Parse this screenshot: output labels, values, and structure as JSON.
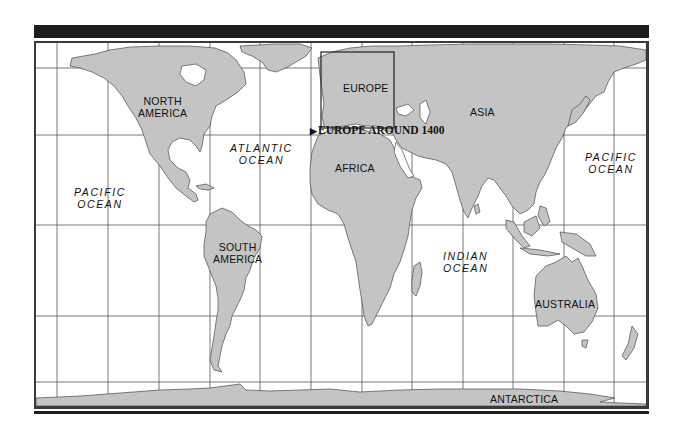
{
  "map": {
    "type": "world-map",
    "projection_grid": {
      "vertical_gridlines_x": [
        57,
        108,
        159,
        210,
        260,
        311,
        362,
        412,
        463,
        513,
        564,
        614
      ],
      "horizontal_gridlines_y": [
        68,
        135,
        225,
        316,
        382
      ]
    },
    "colors": {
      "land": "#c4c4c4",
      "land_outline": "#4a4a4a",
      "ocean": "#ffffff",
      "grid": "#555555",
      "frame": "#3a3a3a",
      "title_bar": "#1e1e1e"
    },
    "continents": [
      {
        "name": "NORTH AMERICA",
        "line1": "NORTH",
        "line2": "AMERICA"
      },
      {
        "name": "SOUTH AMERICA",
        "line1": "SOUTH",
        "line2": "AMERICA"
      },
      {
        "name": "EUROPE",
        "line1": "EUROPE"
      },
      {
        "name": "AFRICA",
        "line1": "AFRICA"
      },
      {
        "name": "ASIA",
        "line1": "ASIA"
      },
      {
        "name": "AUSTRALIA",
        "line1": "AUSTRALIA"
      },
      {
        "name": "ANTARCTICA",
        "line1": "ANTARCTICA"
      }
    ],
    "oceans": [
      {
        "name": "PACIFIC OCEAN (west)",
        "line1": "PACIFIC",
        "line2": "OCEAN"
      },
      {
        "name": "ATLANTIC OCEAN",
        "line1": "ATLANTIC",
        "line2": "OCEAN"
      },
      {
        "name": "INDIAN OCEAN",
        "line1": "INDIAN",
        "line2": "OCEAN"
      },
      {
        "name": "PACIFIC OCEAN (east)",
        "line1": "PACIFIC",
        "line2": "OCEAN"
      }
    ],
    "inset": {
      "region": "EUROPE",
      "callout_arrow": "▶",
      "callout_label": "EUROPE AROUND 1400"
    }
  }
}
